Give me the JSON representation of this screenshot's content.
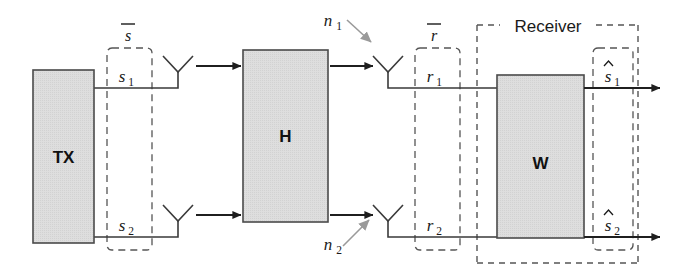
{
  "diagram": {
    "type": "block-diagram",
    "canvas": {
      "width": 686,
      "height": 278
    },
    "colors": {
      "block_fill": "#dcdcdc",
      "block_stroke": "#4a4a4a",
      "line": "#3a3a3a",
      "dashed": "#555555",
      "noise_arrow": "#9a9a9a",
      "text": "#1a1a1a",
      "background": "#ffffff"
    },
    "blocks": [
      {
        "id": "tx",
        "label": "TX",
        "x": 33,
        "y": 70,
        "w": 61,
        "h": 173
      },
      {
        "id": "h",
        "label": "H",
        "x": 243,
        "y": 50,
        "w": 85,
        "h": 172
      },
      {
        "id": "w",
        "label": "W",
        "x": 497,
        "y": 75,
        "w": 87,
        "h": 163
      }
    ],
    "vector_labels": [
      {
        "id": "s-bar",
        "base": "s",
        "overline": true,
        "x": 128,
        "y": 40
      },
      {
        "id": "r-bar",
        "base": "r",
        "overline": true,
        "x": 434,
        "y": 40
      }
    ],
    "signal_labels": [
      {
        "id": "s1",
        "base": "s",
        "sub": "1",
        "hat": false,
        "x": 122,
        "y": 95
      },
      {
        "id": "s2",
        "base": "s",
        "sub": "2",
        "hat": false,
        "x": 122,
        "y": 232
      },
      {
        "id": "r1",
        "base": "r",
        "sub": "1",
        "hat": false,
        "x": 430,
        "y": 95
      },
      {
        "id": "r2",
        "base": "r",
        "sub": "2",
        "hat": false,
        "x": 430,
        "y": 232
      },
      {
        "id": "s1-hat",
        "base": "s",
        "sub": "1",
        "hat": true,
        "x": 608,
        "y": 95
      },
      {
        "id": "s2-hat",
        "base": "s",
        "sub": "2",
        "hat": true,
        "x": 608,
        "y": 232
      }
    ],
    "noise_labels": [
      {
        "id": "n1",
        "base": "n",
        "sub": "1",
        "x": 324,
        "y": 26
      },
      {
        "id": "n2",
        "base": "n",
        "sub": "2",
        "x": 324,
        "y": 250
      }
    ],
    "group_labels": [
      {
        "id": "receiver",
        "text": "Receiver",
        "x": 505,
        "y": 31
      }
    ],
    "dashed_groups": [
      {
        "id": "s-group",
        "x": 107,
        "y": 48,
        "w": 45,
        "h": 202
      },
      {
        "id": "r-group",
        "x": 415,
        "y": 48,
        "w": 45,
        "h": 202
      },
      {
        "id": "s-hat-group",
        "x": 593,
        "y": 48,
        "w": 40,
        "h": 202
      },
      {
        "id": "receiver-group",
        "x": 477,
        "y": 25,
        "w": 161,
        "h": 238
      }
    ],
    "antennas": [
      {
        "id": "tx-antenna-1",
        "x": 178,
        "y": 88
      },
      {
        "id": "tx-antenna-2",
        "x": 178,
        "y": 237
      },
      {
        "id": "rx-antenna-1",
        "x": 388,
        "y": 88
      },
      {
        "id": "rx-antenna-2",
        "x": 388,
        "y": 237
      }
    ],
    "channel_arrows": [
      {
        "id": "channel-arrow-top",
        "from_x": 196,
        "to_x": 240,
        "y": 66
      },
      {
        "id": "channel-arrow-bottom",
        "from_x": 196,
        "to_x": 240,
        "y": 215
      },
      {
        "id": "rx-arrow-top",
        "from_x": 330,
        "to_x": 372,
        "y": 66
      },
      {
        "id": "rx-arrow-bottom",
        "from_x": 330,
        "to_x": 372,
        "y": 215
      }
    ],
    "output_arrows": [
      {
        "id": "output-arrow-1",
        "from_x": 584,
        "to_x": 658,
        "y": 88
      },
      {
        "id": "output-arrow-2",
        "from_x": 584,
        "to_x": 658,
        "y": 237
      }
    ],
    "noise_arrows": [
      {
        "id": "noise-arrow-1",
        "x1": 348,
        "y1": 21,
        "x2": 372,
        "y2": 43
      },
      {
        "id": "noise-arrow-2",
        "x1": 344,
        "y1": 244,
        "x2": 370,
        "y2": 220
      }
    ]
  }
}
